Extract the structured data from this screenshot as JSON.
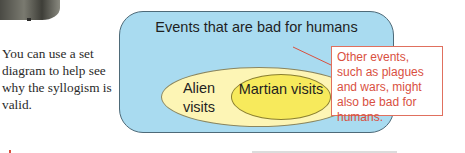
{
  "caption": {
    "text": "You can use a set diagram to help see why the syllogism is valid."
  },
  "diagram": {
    "outer_set": {
      "label": "Events that are bad for humans",
      "color": "#a9dbf0"
    },
    "middle_set": {
      "label": "Alien visits",
      "color": "#fdf5b5"
    },
    "inner_set": {
      "label": "Martian visits",
      "color": "#f7ea5c"
    },
    "note": {
      "text": "Other events, such as plagues and wars, might also be bad for humans.",
      "color": "#d9503f"
    }
  }
}
